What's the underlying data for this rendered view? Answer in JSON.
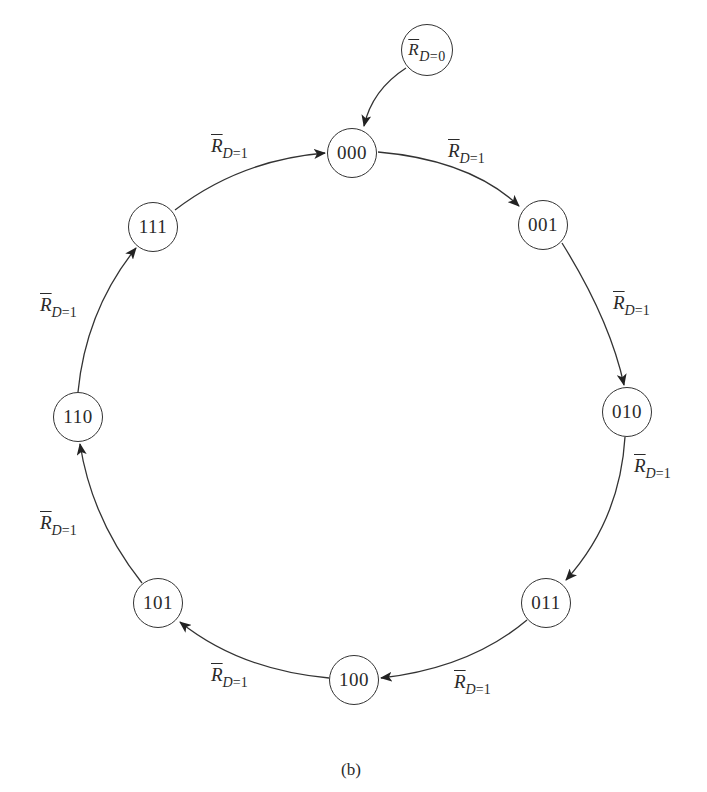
{
  "diagram": {
    "type": "state-transition-ring",
    "caption": "(b)",
    "initial": {
      "symbol": "R",
      "sub_var": "D",
      "sub_eq": "=0",
      "target": "000"
    },
    "states": [
      {
        "id": "000",
        "label": "000"
      },
      {
        "id": "001",
        "label": "001"
      },
      {
        "id": "010",
        "label": "010"
      },
      {
        "id": "011",
        "label": "011"
      },
      {
        "id": "100",
        "label": "100"
      },
      {
        "id": "101",
        "label": "101"
      },
      {
        "id": "110",
        "label": "110"
      },
      {
        "id": "111",
        "label": "111"
      }
    ],
    "transitions": [
      {
        "from": "000",
        "to": "001",
        "symbol": "R",
        "sub_var": "D",
        "sub_eq": "=1"
      },
      {
        "from": "001",
        "to": "010",
        "symbol": "R",
        "sub_var": "D",
        "sub_eq": "=1"
      },
      {
        "from": "010",
        "to": "011",
        "symbol": "R",
        "sub_var": "D",
        "sub_eq": "=1"
      },
      {
        "from": "011",
        "to": "100",
        "symbol": "R",
        "sub_var": "D",
        "sub_eq": "=1"
      },
      {
        "from": "100",
        "to": "101",
        "symbol": "R",
        "sub_var": "D",
        "sub_eq": "=1"
      },
      {
        "from": "101",
        "to": "110",
        "symbol": "R",
        "sub_var": "D",
        "sub_eq": "=1"
      },
      {
        "from": "110",
        "to": "111",
        "symbol": "R",
        "sub_var": "D",
        "sub_eq": "=1"
      },
      {
        "from": "111",
        "to": "000",
        "symbol": "R",
        "sub_var": "D",
        "sub_eq": "=1"
      }
    ],
    "colors": {
      "stroke": "#333333",
      "text": "#2a2a2a",
      "background": "#ffffff"
    }
  }
}
